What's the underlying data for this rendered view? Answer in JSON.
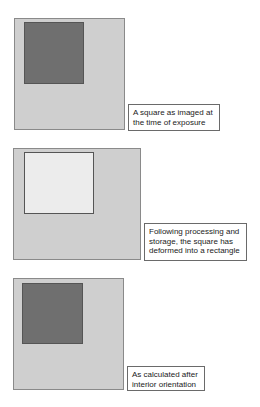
{
  "colors": {
    "frame_fill": "#cfcfcf",
    "square_dark": "#6f6f6f",
    "square_light": "#ececec"
  },
  "panels": [
    {
      "frame": {
        "x": 14,
        "y": 18,
        "w": 111,
        "h": 112
      },
      "square": {
        "x": 24,
        "y": 22,
        "w": 60,
        "h": 62,
        "fill": "#6f6f6f"
      },
      "label_box": {
        "x": 128,
        "y": 104,
        "w": 92,
        "h": 27
      },
      "label_lines": [
        "A square as imaged at",
        "the time of exposure"
      ]
    },
    {
      "frame": {
        "x": 13,
        "y": 148,
        "w": 128,
        "h": 112
      },
      "square": {
        "x": 24,
        "y": 152,
        "w": 70,
        "h": 62,
        "fill": "#ececec"
      },
      "label_box": {
        "x": 144,
        "y": 223,
        "w": 103,
        "h": 38
      },
      "label_lines": [
        "Following processing and",
        "storage, the square has",
        "deformed into a rectangle"
      ]
    },
    {
      "frame": {
        "x": 13,
        "y": 278,
        "w": 111,
        "h": 112
      },
      "square": {
        "x": 22,
        "y": 283,
        "w": 61,
        "h": 61,
        "fill": "#6f6f6f"
      },
      "label_box": {
        "x": 127,
        "y": 366,
        "w": 78,
        "h": 25
      },
      "label_lines": [
        "As calculated after",
        "interior orientation"
      ]
    }
  ]
}
